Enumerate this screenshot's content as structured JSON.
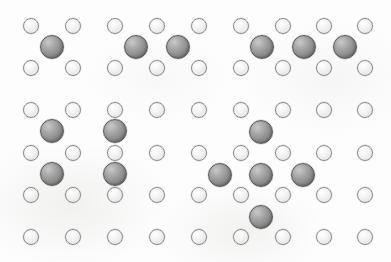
{
  "figure": {
    "width": 391,
    "height": 262,
    "background_color": "#fdfdfd"
  },
  "legend": {
    "site_label": "lattice site (small open circle)",
    "atom_label": "cluster atom (large shaded circle)",
    "site_color": "#eeeeee",
    "site_outline_color": "#8e8e8e",
    "atom_color": "#8b8b8b",
    "atom_outline_color": "#5c5c5c"
  },
  "chart_data": {
    "type": "scatter",
    "xlabel": "",
    "ylabel": "",
    "xlim": [
      0,
      391
    ],
    "ylim": [
      0,
      262
    ],
    "grid": false,
    "legend_position": "none",
    "lattice": {
      "columns": 9,
      "rows": 6,
      "column_x": [
        31,
        73,
        115,
        157,
        199,
        241,
        283,
        324,
        365
      ],
      "row_y": [
        26,
        68,
        110,
        153,
        195,
        237
      ],
      "site_diameter": 16,
      "spacing_x": 41.8,
      "spacing_y": 42.2
    },
    "series": [
      {
        "name": "lattice-sites",
        "marker": "open-circle",
        "size": 16,
        "color": "#eeeeee",
        "points": [
          [
            31,
            26
          ],
          [
            73,
            26
          ],
          [
            115,
            26
          ],
          [
            157,
            26
          ],
          [
            199,
            26
          ],
          [
            241,
            26
          ],
          [
            283,
            26
          ],
          [
            324,
            26
          ],
          [
            365,
            26
          ],
          [
            31,
            68
          ],
          [
            73,
            68
          ],
          [
            115,
            68
          ],
          [
            157,
            68
          ],
          [
            199,
            68
          ],
          [
            241,
            68
          ],
          [
            283,
            68
          ],
          [
            324,
            68
          ],
          [
            365,
            68
          ],
          [
            31,
            110
          ],
          [
            73,
            110
          ],
          [
            115,
            110
          ],
          [
            157,
            110
          ],
          [
            199,
            110
          ],
          [
            241,
            110
          ],
          [
            283,
            110
          ],
          [
            324,
            110
          ],
          [
            365,
            110
          ],
          [
            31,
            153
          ],
          [
            73,
            153
          ],
          [
            115,
            153
          ],
          [
            157,
            153
          ],
          [
            199,
            153
          ],
          [
            241,
            153
          ],
          [
            283,
            153
          ],
          [
            324,
            153
          ],
          [
            365,
            153
          ],
          [
            31,
            195
          ],
          [
            73,
            195
          ],
          [
            115,
            195
          ],
          [
            157,
            195
          ],
          [
            199,
            195
          ],
          [
            241,
            195
          ],
          [
            283,
            195
          ],
          [
            324,
            195
          ],
          [
            365,
            195
          ],
          [
            31,
            237
          ],
          [
            73,
            237
          ],
          [
            115,
            237
          ],
          [
            157,
            237
          ],
          [
            199,
            237
          ],
          [
            241,
            237
          ],
          [
            283,
            237
          ],
          [
            324,
            237
          ],
          [
            365,
            237
          ]
        ]
      },
      {
        "name": "cluster-atoms",
        "marker": "filled-circle",
        "size": 24,
        "color": "#8b8b8b",
        "points": [
          [
            52,
            47
          ],
          [
            136,
            47
          ],
          [
            178,
            47
          ],
          [
            262,
            47
          ],
          [
            304,
            47
          ],
          [
            345,
            47
          ],
          [
            52,
            131
          ],
          [
            115,
            131
          ],
          [
            52,
            174
          ],
          [
            115,
            174
          ],
          [
            261,
            132
          ],
          [
            220,
            175
          ],
          [
            261,
            175
          ],
          [
            303,
            175
          ],
          [
            261,
            217
          ]
        ]
      }
    ],
    "clusters": [
      {
        "name": "monomer",
        "atom_count": 1,
        "shape": "single",
        "center": [
          52,
          47
        ]
      },
      {
        "name": "dimer",
        "atom_count": 2,
        "shape": "horizontal-pair",
        "center": [
          157,
          47
        ]
      },
      {
        "name": "trimer",
        "atom_count": 3,
        "shape": "horizontal-row",
        "center": [
          304,
          47
        ]
      },
      {
        "name": "tetramer-square",
        "atom_count": 4,
        "shape": "2x2-square",
        "center": [
          84,
          153
        ]
      },
      {
        "name": "pentamer-cross",
        "atom_count": 5,
        "shape": "plus-cross",
        "center": [
          261,
          175
        ]
      }
    ]
  }
}
